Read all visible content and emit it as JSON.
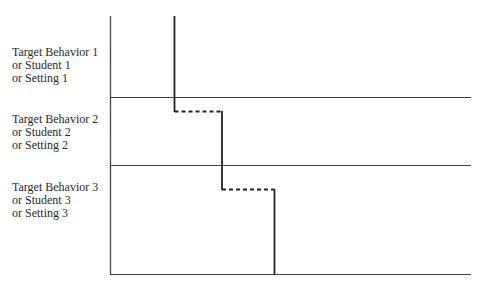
{
  "diagram": {
    "type": "multiple-baseline-design",
    "tiers": [
      {
        "lines": [
          "Target Behavior 1",
          "or Student 1",
          "or Setting 1"
        ]
      },
      {
        "lines": [
          "Target Behavior 2",
          "or Student 2",
          "or Setting 2"
        ]
      },
      {
        "lines": [
          "Target Behavior 3",
          "or Student 3",
          "or Setting 3"
        ]
      }
    ],
    "colors": {
      "axis": "#333333",
      "phase_line": "#222222",
      "text": "#2a2a2a"
    }
  }
}
